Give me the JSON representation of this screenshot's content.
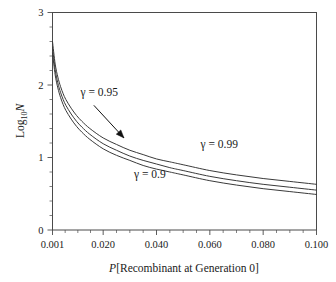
{
  "chart_data": {
    "type": "line",
    "title": "",
    "subtitle": "",
    "xlabel": "P[Recombinant at Generation 0]",
    "ylabel": "Log10N",
    "ylabel_parts": {
      "base": "Log",
      "subscript": "10",
      "variable": "N"
    },
    "xlim": [
      0.001,
      0.1
    ],
    "ylim": [
      0,
      3
    ],
    "xticks": [
      0.001,
      0.02,
      0.04,
      0.06,
      0.08,
      0.1
    ],
    "xtick_labels": [
      "0.001",
      "0.020",
      "0.040",
      "0.060",
      "0.080",
      "0.100"
    ],
    "yticks": [
      0,
      1,
      2,
      3
    ],
    "ytick_labels": [
      "0",
      "1",
      "2",
      "3"
    ],
    "x_minor_tick_count": 3,
    "y_minor_tick_interval": 0.2,
    "grid": false,
    "legend_position": "inline-annotations",
    "x": [
      0.001,
      0.002,
      0.003,
      0.004,
      0.005,
      0.006,
      0.008,
      0.01,
      0.012,
      0.015,
      0.02,
      0.025,
      0.03,
      0.035,
      0.04,
      0.045,
      0.05,
      0.06,
      0.07,
      0.08,
      0.09,
      0.1
    ],
    "series": [
      {
        "name": "gamma = 0.99",
        "label": "γ = 0.99",
        "gamma": 0.99,
        "values": [
          2.6,
          2.29,
          2.11,
          1.98,
          1.88,
          1.8,
          1.68,
          1.58,
          1.5,
          1.4,
          1.27,
          1.18,
          1.1,
          1.04,
          0.98,
          0.94,
          0.9,
          0.82,
          0.76,
          0.71,
          0.67,
          0.63
        ]
      },
      {
        "name": "gamma = 0.95",
        "label": "γ = 0.95",
        "gamma": 0.95,
        "values": [
          2.52,
          2.21,
          2.03,
          1.9,
          1.8,
          1.72,
          1.6,
          1.5,
          1.42,
          1.32,
          1.19,
          1.1,
          1.02,
          0.96,
          0.91,
          0.86,
          0.82,
          0.74,
          0.68,
          0.63,
          0.59,
          0.55
        ]
      },
      {
        "name": "gamma = 0.9",
        "label": "γ = 0.9",
        "gamma": 0.9,
        "values": [
          2.44,
          2.14,
          1.96,
          1.83,
          1.73,
          1.65,
          1.53,
          1.43,
          1.35,
          1.25,
          1.12,
          1.03,
          0.96,
          0.89,
          0.84,
          0.8,
          0.76,
          0.68,
          0.62,
          0.57,
          0.53,
          0.49
        ]
      }
    ],
    "annotations": [
      {
        "name": "gamma-095-callout",
        "text": "γ = 0.95",
        "text_x": 0.0185,
        "text_y": 1.85,
        "arrow_from": {
          "x": 0.0165,
          "y": 1.72
        },
        "arrow_to": {
          "x": 0.0278,
          "y": 1.27
        }
      },
      {
        "name": "gamma-099-label",
        "text": "γ = 0.99",
        "text_x": 0.0635,
        "text_y": 1.13
      },
      {
        "name": "gamma-09-label",
        "text": "γ = 0.9",
        "text_x": 0.0375,
        "text_y": 0.72
      }
    ],
    "colors": {
      "curve": "#3a3a3a",
      "axis": "#4a4a4a",
      "text": "#1a1a1a",
      "background": "#ffffff",
      "annotation": "#111111"
    }
  }
}
